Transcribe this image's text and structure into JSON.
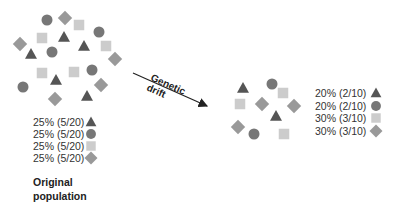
{
  "colors": {
    "triangle": "#555555",
    "circle": "#777777",
    "square": "#cccccc",
    "diamond": "#999999"
  },
  "original": {
    "title_line1": "Original",
    "title_line2": "population",
    "legend": [
      {
        "shape": "triangle",
        "label": "25% (5/20)"
      },
      {
        "shape": "circle",
        "label": "25% (5/20)"
      },
      {
        "shape": "square",
        "label": "25% (5/20)"
      },
      {
        "shape": "diamond",
        "label": "25% (5/20)"
      }
    ],
    "individuals": [
      {
        "shape": "circle",
        "x": 47,
        "y": 20
      },
      {
        "shape": "diamond",
        "x": 65,
        "y": 18
      },
      {
        "shape": "square",
        "x": 79,
        "y": 25
      },
      {
        "shape": "circle",
        "x": 99,
        "y": 32
      },
      {
        "shape": "square",
        "x": 42,
        "y": 38
      },
      {
        "shape": "triangle",
        "x": 64,
        "y": 37
      },
      {
        "shape": "triangle",
        "x": 84,
        "y": 46
      },
      {
        "shape": "square",
        "x": 106,
        "y": 46
      },
      {
        "shape": "diamond",
        "x": 20,
        "y": 44
      },
      {
        "shape": "triangle",
        "x": 31,
        "y": 54
      },
      {
        "shape": "circle",
        "x": 52,
        "y": 52
      },
      {
        "shape": "diamond",
        "x": 115,
        "y": 59
      },
      {
        "shape": "square",
        "x": 42,
        "y": 73
      },
      {
        "shape": "square",
        "x": 74,
        "y": 72
      },
      {
        "shape": "circle",
        "x": 92,
        "y": 70
      },
      {
        "shape": "circle",
        "x": 23,
        "y": 87
      },
      {
        "shape": "triangle",
        "x": 56,
        "y": 80
      },
      {
        "shape": "diamond",
        "x": 101,
        "y": 85
      },
      {
        "shape": "diamond",
        "x": 55,
        "y": 99
      },
      {
        "shape": "triangle",
        "x": 87,
        "y": 96
      }
    ]
  },
  "arrow": {
    "line1": "Genetic",
    "line2": "drift"
  },
  "drifted": {
    "legend": [
      {
        "shape": "triangle",
        "label": "20% (2/10)"
      },
      {
        "shape": "circle",
        "label": "20% (2/10)"
      },
      {
        "shape": "square",
        "label": "30% (3/10)"
      },
      {
        "shape": "diamond",
        "label": "30% (3/10)"
      }
    ],
    "individuals": [
      {
        "shape": "triangle",
        "x": 243,
        "y": 88
      },
      {
        "shape": "circle",
        "x": 272,
        "y": 84
      },
      {
        "shape": "square",
        "x": 283,
        "y": 93
      },
      {
        "shape": "square",
        "x": 240,
        "y": 104
      },
      {
        "shape": "diamond",
        "x": 262,
        "y": 104
      },
      {
        "shape": "diamond",
        "x": 294,
        "y": 106
      },
      {
        "shape": "triangle",
        "x": 276,
        "y": 116
      },
      {
        "shape": "diamond",
        "x": 238,
        "y": 127
      },
      {
        "shape": "circle",
        "x": 254,
        "y": 134
      },
      {
        "shape": "square",
        "x": 284,
        "y": 134
      }
    ]
  }
}
